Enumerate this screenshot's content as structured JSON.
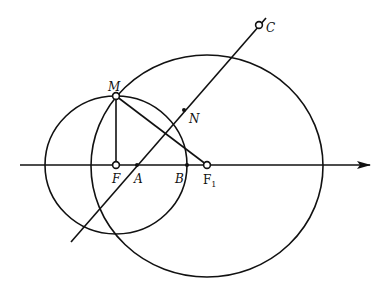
{
  "diagram": {
    "type": "geometry",
    "stroke_color": "#111111",
    "background": "#ffffff",
    "axis": {
      "x1": 20,
      "y": 165,
      "x2": 370
    },
    "small_circle": {
      "cx": 116,
      "cy": 165,
      "rx": 71,
      "ry": 69
    },
    "large_circle": {
      "cx": 207,
      "cy": 166,
      "rx": 116,
      "ry": 111
    },
    "segments": [
      {
        "name": "MF",
        "x1": 116,
        "y1": 96,
        "x2": 116,
        "y2": 165
      },
      {
        "name": "MF1",
        "x1": 116,
        "y1": 96,
        "x2": 207,
        "y2": 165
      },
      {
        "name": "line-AC",
        "x1": 71,
        "y1": 242,
        "x2": 266,
        "y2": 18
      }
    ],
    "points": [
      {
        "label": "M",
        "x": 116,
        "y": 96,
        "style": "open",
        "lx": 108,
        "ly": 91
      },
      {
        "label": "N",
        "x": 184,
        "y": 110,
        "style": "dot",
        "lx": 189,
        "ly": 123
      },
      {
        "label": "C",
        "x": 259,
        "y": 25,
        "style": "open",
        "lx": 266,
        "ly": 32
      },
      {
        "label": "F",
        "x": 116,
        "y": 165,
        "style": "open",
        "lx": 112,
        "ly": 183
      },
      {
        "label": "A",
        "x": 137,
        "y": 165,
        "style": "dot",
        "lx": 134,
        "ly": 183
      },
      {
        "label": "B",
        "x": 187,
        "y": 165,
        "style": "dot",
        "lx": 175,
        "ly": 183
      },
      {
        "label": "F",
        "sub": "1",
        "x": 207,
        "y": 165,
        "style": "open",
        "lx": 203,
        "ly": 184
      }
    ]
  }
}
